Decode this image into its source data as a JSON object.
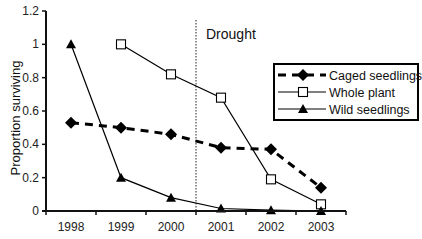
{
  "chart_data": {
    "type": "line",
    "title": "",
    "xlabel": "",
    "ylabel": "Proportion surviving",
    "categories": [
      "1998",
      "1999",
      "2000",
      "2001",
      "2002",
      "2003"
    ],
    "ylim": [
      0,
      1.2
    ],
    "yticks": [
      0,
      0.2,
      0.4,
      0.6,
      0.8,
      1,
      1.2
    ],
    "ytick_labels": [
      "0",
      "0.2",
      "0.4",
      "0.6",
      "0.8",
      "1",
      "1.2"
    ],
    "grid": false,
    "legend_position": "right",
    "annotations": [
      {
        "type": "vline",
        "between": [
          "2000",
          "2001"
        ],
        "style": "dotted",
        "label": "Drought"
      }
    ],
    "series": [
      {
        "name": "Caged seedlings",
        "marker": "diamond-filled",
        "line": "dashed-thick",
        "values": [
          0.53,
          0.5,
          0.46,
          0.38,
          0.37,
          0.14
        ]
      },
      {
        "name": "Whole plant",
        "marker": "square-open",
        "line": "solid",
        "values": [
          null,
          1.0,
          0.82,
          0.68,
          0.19,
          0.04
        ]
      },
      {
        "name": "Wild seedlings",
        "marker": "triangle-filled",
        "line": "solid",
        "values": [
          1.0,
          0.2,
          0.08,
          0.015,
          0.005,
          0.0
        ]
      }
    ]
  }
}
